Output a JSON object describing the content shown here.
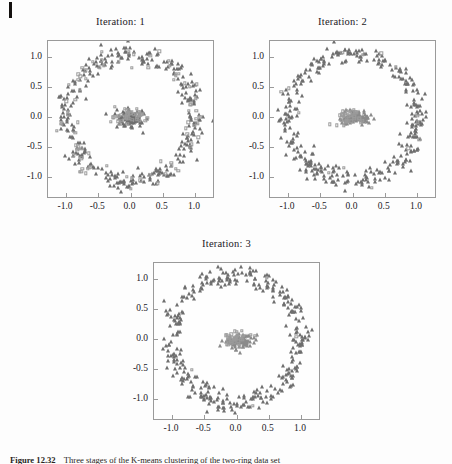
{
  "figure": {
    "caption_label": "Figure 12.32",
    "caption_text": "Three stages of the K-means clustering of the two-ring data set",
    "scan_artifact": "page-edge-mark"
  },
  "axes": {
    "x_ticks": [
      "-1.0",
      "-0.5",
      "0.0",
      "0.5",
      "1.0"
    ],
    "x_tick_values": [
      -1.0,
      -0.5,
      0.0,
      0.5,
      1.0
    ],
    "y_ticks": [
      "1.0",
      "0.5",
      "0.0",
      "-0.5",
      "-1.0"
    ],
    "y_tick_values": [
      1.0,
      0.5,
      0.0,
      -0.5,
      -1.0
    ],
    "xlim": [
      -1.28,
      1.28
    ],
    "ylim": [
      -1.33,
      1.27
    ],
    "grid": false,
    "frame_color": "#9a9a9a"
  },
  "panels": [
    {
      "id": "panel-1",
      "title": "Iteration: 1"
    },
    {
      "id": "panel-2",
      "title": "Iteration: 2"
    },
    {
      "id": "panel-3",
      "title": "Iteration: 3"
    }
  ],
  "chart_data": [
    {
      "type": "scatter",
      "title": "Iteration: 1",
      "xlabel": "",
      "ylabel": "",
      "xlim": [
        -1.28,
        1.28
      ],
      "ylim": [
        -1.33,
        1.27
      ],
      "grid": false,
      "legend": "none",
      "annotations": [],
      "series": [
        {
          "name": "cluster-a",
          "marker": "triangle",
          "color": "#6e6e6e",
          "n": 300,
          "shape": "ring",
          "ring_radius": 1.0,
          "ring_noise": 0.085,
          "center": [
            0.0,
            0.0
          ],
          "arc_start_deg": 0,
          "arc_end_deg": 360,
          "seed": 11
        },
        {
          "name": "cluster-b",
          "marker": "square",
          "color": "#9b9b9b",
          "n": 80,
          "shape": "ring",
          "ring_radius": 1.0,
          "ring_noise": 0.085,
          "center": [
            0.0,
            0.0
          ],
          "arc_start_deg": 0,
          "arc_end_deg": 360,
          "seed": 23
        },
        {
          "name": "cluster-core-a",
          "marker": "triangle",
          "color": "#6e6e6e",
          "n": 95,
          "shape": "blob",
          "center": [
            0.02,
            -0.02
          ],
          "spread_x": 0.115,
          "spread_y": 0.072,
          "seed": 31
        },
        {
          "name": "cluster-core-b",
          "marker": "square",
          "color": "#9b9b9b",
          "n": 40,
          "shape": "blob",
          "center": [
            -0.02,
            0.0
          ],
          "spread_x": 0.115,
          "spread_y": 0.072,
          "seed": 47
        }
      ]
    },
    {
      "type": "scatter",
      "title": "Iteration: 2",
      "xlabel": "",
      "ylabel": "",
      "xlim": [
        -1.28,
        1.28
      ],
      "ylim": [
        -1.33,
        1.27
      ],
      "grid": false,
      "legend": "none",
      "annotations": [],
      "series": [
        {
          "name": "cluster-a",
          "marker": "triangle",
          "color": "#6e6e6e",
          "n": 330,
          "shape": "ring",
          "ring_radius": 1.0,
          "ring_noise": 0.08,
          "center": [
            0.0,
            0.0
          ],
          "arc_start_deg": 0,
          "arc_end_deg": 360,
          "seed": 57
        },
        {
          "name": "cluster-b",
          "marker": "square",
          "color": "#9b9b9b",
          "n": 14,
          "shape": "ring",
          "ring_radius": 1.0,
          "ring_noise": 0.08,
          "center": [
            0.0,
            0.0
          ],
          "arc_start_deg": 0,
          "arc_end_deg": 360,
          "seed": 61
        },
        {
          "name": "cluster-core-a",
          "marker": "triangle",
          "color": "#8a8a8a",
          "n": 110,
          "shape": "blob",
          "center": [
            0.04,
            -0.01
          ],
          "spread_x": 0.1,
          "spread_y": 0.058,
          "seed": 73
        },
        {
          "name": "cluster-core-b",
          "marker": "square",
          "color": "#9b9b9b",
          "n": 34,
          "shape": "blob",
          "center": [
            -0.05,
            0.01
          ],
          "spread_x": 0.115,
          "spread_y": 0.072,
          "seed": 89
        }
      ]
    },
    {
      "type": "scatter",
      "title": "Iteration: 3",
      "xlabel": "",
      "ylabel": "",
      "xlim": [
        -1.28,
        1.28
      ],
      "ylim": [
        -1.33,
        1.27
      ],
      "grid": false,
      "legend": "none",
      "annotations": [],
      "series": [
        {
          "name": "cluster-a",
          "marker": "triangle",
          "color": "#6e6e6e",
          "n": 340,
          "shape": "ring",
          "ring_radius": 1.0,
          "ring_noise": 0.08,
          "center": [
            0.0,
            0.0
          ],
          "arc_start_deg": 0,
          "arc_end_deg": 360,
          "seed": 97
        },
        {
          "name": "cluster-b",
          "marker": "square",
          "color": "#9b9b9b",
          "n": 4,
          "shape": "ring",
          "ring_radius": 1.0,
          "ring_noise": 0.08,
          "center": [
            0.0,
            0.0
          ],
          "arc_start_deg": 0,
          "arc_end_deg": 360,
          "seed": 101
        },
        {
          "name": "cluster-core-a",
          "marker": "triangle",
          "color": "#8a8a8a",
          "n": 105,
          "shape": "blob",
          "center": [
            0.05,
            -0.02
          ],
          "spread_x": 0.095,
          "spread_y": 0.055,
          "seed": 103
        },
        {
          "name": "cluster-core-b",
          "marker": "square",
          "color": "#9b9b9b",
          "n": 36,
          "shape": "blob",
          "center": [
            -0.04,
            0.01
          ],
          "spread_x": 0.1,
          "spread_y": 0.065,
          "seed": 107
        }
      ]
    }
  ]
}
